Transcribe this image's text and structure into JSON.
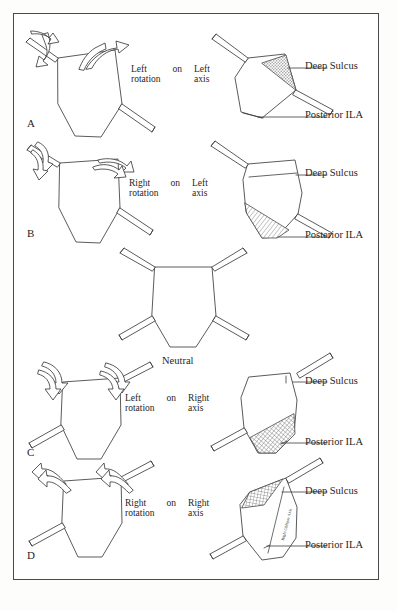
{
  "figure": {
    "background_color": "#ffffff",
    "border_color": "#4a4a4a",
    "ink_color": "#3a3a3a",
    "shade_color": "#9a9a9a",
    "title_present": false
  },
  "panels": [
    {
      "letter": "A",
      "condition": {
        "direction": "Left",
        "motion": "rotation",
        "preposition": "on",
        "axis_side": "Left",
        "axis_word": "axis"
      },
      "callouts": [
        {
          "name": "deep-sulcus",
          "text": "Deep Sulcus"
        },
        {
          "name": "posterior-ila",
          "text": "Posterior ILA"
        }
      ],
      "shaded_region": "deep-sulcus",
      "shade_style": "stipple"
    },
    {
      "letter": "B",
      "condition": {
        "direction": "Right",
        "motion": "rotation",
        "preposition": "on",
        "axis_side": "Left",
        "axis_word": "axis"
      },
      "callouts": [
        {
          "name": "deep-sulcus",
          "text": "Deep Sulcus"
        },
        {
          "name": "posterior-ila",
          "text": "Posterior ILA"
        }
      ],
      "shaded_region": "posterior-ila",
      "shade_style": "diagonal-hatch"
    },
    {
      "letter": "",
      "condition": {
        "direction": "",
        "motion": "",
        "preposition": "",
        "axis_side": "",
        "axis_word": ""
      },
      "neutral_label": "Neutral",
      "callouts": [],
      "shaded_region": "none",
      "shade_style": "none"
    },
    {
      "letter": "C",
      "condition": {
        "direction": "Left",
        "motion": "rotation",
        "preposition": "on",
        "axis_side": "Right",
        "axis_word": "axis"
      },
      "callouts": [
        {
          "name": "deep-sulcus",
          "text": "Deep Sulcus"
        },
        {
          "name": "posterior-ila",
          "text": "Posterior  ILA"
        }
      ],
      "shaded_region": "posterior-ila",
      "shade_style": "cross-hatch"
    },
    {
      "letter": "D",
      "condition": {
        "direction": "Right",
        "motion": "rotation",
        "preposition": "on",
        "axis_side": "Right",
        "axis_word": "axis"
      },
      "callouts": [
        {
          "name": "deep-sulcus",
          "text": "Deep Sulcus"
        },
        {
          "name": "posterior-ila",
          "text": "Posterior  ILA"
        }
      ],
      "shaded_region": "deep-sulcus",
      "shade_style": "cross-hatch",
      "axis_annotation": "Right Oblique Axis"
    }
  ],
  "center": {
    "neutral_label": "Neutral"
  }
}
